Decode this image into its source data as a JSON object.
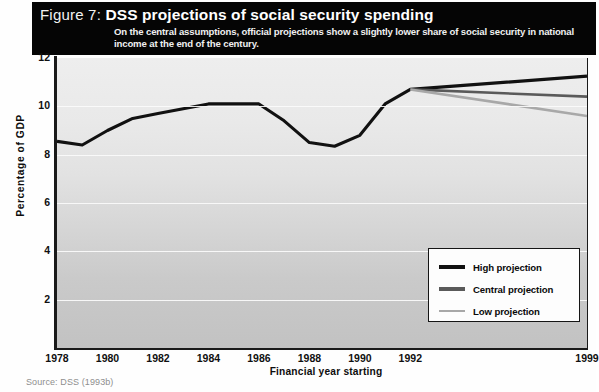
{
  "header": {
    "figure_label": "Figure 7:",
    "title": "DSS projections of social security spending",
    "subtitle": "On the central assumptions, official projections show a slightly lower share of social security in national income at the end of the century."
  },
  "source_note": "Source: DSS (1993b)",
  "colors": {
    "high": "#111111",
    "central": "#5a5a5a",
    "low": "#a8a8a8",
    "header_bg": "#050505",
    "gridline": "#fbfbfb",
    "axis": "#1a1a1a"
  },
  "legend": {
    "position": "bottom-right",
    "items": [
      {
        "label": "High projection",
        "color": "#111111"
      },
      {
        "label": "Central projection",
        "color": "#5a5a5a"
      },
      {
        "label": "Low projection",
        "color": "#a8a8a8"
      }
    ]
  },
  "chart_data": {
    "type": "line",
    "title": "DSS projections of social security spending",
    "subtitle": "On the central assumptions, official projections show a slightly lower share of social security in national income at the end of the century.",
    "xlabel": "Financial year starting",
    "ylabel": "Percentage of GDP",
    "xlim": [
      1978,
      1999
    ],
    "ylim": [
      0,
      12
    ],
    "yticks": [
      2,
      4,
      6,
      8,
      10,
      12
    ],
    "xticks": [
      1978,
      1980,
      1982,
      1984,
      1986,
      1988,
      1990,
      1992,
      1999
    ],
    "grid": true,
    "grid_axis": "y",
    "series": [
      {
        "name": "High projection",
        "color": "#111111",
        "x": [
          1978,
          1979,
          1980,
          1981,
          1982,
          1983,
          1984,
          1985,
          1986,
          1987,
          1988,
          1989,
          1990,
          1991,
          1992,
          1999
        ],
        "values": [
          8.55,
          8.4,
          9.0,
          9.5,
          9.7,
          9.9,
          10.1,
          10.1,
          10.1,
          9.4,
          8.5,
          8.35,
          8.8,
          10.1,
          10.7,
          11.25
        ]
      },
      {
        "name": "Central projection",
        "color": "#5a5a5a",
        "x": [
          1992,
          1999
        ],
        "values": [
          10.7,
          10.4
        ]
      },
      {
        "name": "Low projection",
        "color": "#a8a8a8",
        "x": [
          1992,
          1999
        ],
        "values": [
          10.7,
          9.6
        ]
      }
    ]
  }
}
